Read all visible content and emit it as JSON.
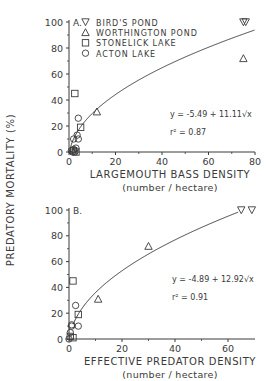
{
  "y_axis_shared_label": "PREDATORY MORTALITY (%)",
  "legend": {
    "items": [
      {
        "symbol": "triangle-down",
        "label": "BIRD'S POND"
      },
      {
        "symbol": "triangle-up",
        "label": "WORTHINGTON POND"
      },
      {
        "symbol": "square",
        "label": "STONELICK LAKE"
      },
      {
        "symbol": "circle",
        "label": "ACTON LAKE"
      }
    ]
  },
  "panelA": {
    "tag": "A.",
    "xlabel": "LARGEMOUTH BASS DENSITY",
    "xunits": "(number / hectare)",
    "equation": "y = -5.49 + 11.11√x",
    "r2": "r² = 0.87",
    "xticks": [
      "0",
      "20",
      "40",
      "60",
      "80"
    ],
    "yticks": [
      "0",
      "20",
      "40",
      "60",
      "80",
      "100"
    ]
  },
  "panelB": {
    "tag": "B.",
    "xlabel": "EFFECTIVE PREDATOR DENSITY",
    "xunits": "(number / hectare)",
    "equation": "y = -4.89 + 12.92√x",
    "r2": "r² = 0.91",
    "xticks": [
      "0",
      "20",
      "40",
      "60"
    ],
    "yticks": [
      "0",
      "20",
      "40",
      "60",
      "80",
      "100"
    ]
  },
  "chart_data": [
    {
      "type": "scatter",
      "title": "A.",
      "xlabel": "LARGEMOUTH BASS DENSITY (number / hectare)",
      "ylabel": "PREDATORY MORTALITY (%)",
      "xlim": [
        0,
        80
      ],
      "ylim": [
        0,
        100
      ],
      "grid": false,
      "legend_position": "upper left",
      "fit": {
        "equation": "y = -5.49 + 11.11*sqrt(x)",
        "r2": 0.87
      },
      "series": [
        {
          "name": "BIRD'S POND",
          "marker": "triangle-down",
          "x": [
            75,
            76
          ],
          "y": [
            100,
            100
          ]
        },
        {
          "name": "WORTHINGTON POND",
          "marker": "triangle-up",
          "x": [
            12,
            75
          ],
          "y": [
            31,
            72
          ]
        },
        {
          "name": "STONELICK LAKE",
          "marker": "square",
          "x": [
            2.5,
            5,
            3,
            2
          ],
          "y": [
            45,
            19,
            0,
            1
          ]
        },
        {
          "name": "ACTON LAKE",
          "marker": "circle",
          "x": [
            4,
            3.5,
            2,
            4,
            3,
            1,
            2,
            1.5,
            2.5
          ],
          "y": [
            26,
            13,
            10,
            10,
            3,
            1,
            2,
            0,
            0
          ]
        }
      ]
    },
    {
      "type": "scatter",
      "title": "B.",
      "xlabel": "EFFECTIVE PREDATOR DENSITY (number / hectare)",
      "ylabel": "PREDATORY MORTALITY (%)",
      "xlim": [
        0,
        70
      ],
      "ylim": [
        0,
        100
      ],
      "grid": false,
      "fit": {
        "equation": "y = -4.89 + 12.92*sqrt(x)",
        "r2": 0.91
      },
      "series": [
        {
          "name": "BIRD'S POND",
          "marker": "triangle-down",
          "x": [
            65,
            69
          ],
          "y": [
            100,
            100
          ]
        },
        {
          "name": "WORTHINGTON POND",
          "marker": "triangle-up",
          "x": [
            11,
            30
          ],
          "y": [
            31,
            72
          ]
        },
        {
          "name": "STONELICK LAKE",
          "marker": "square",
          "x": [
            1.5,
            3.5,
            1.5,
            0.5
          ],
          "y": [
            45,
            19,
            1,
            2
          ]
        },
        {
          "name": "ACTON LAKE",
          "marker": "circle",
          "x": [
            2.5,
            1,
            3.5,
            1,
            0.5,
            0
          ],
          "y": [
            26,
            11,
            10,
            10,
            5,
            0
          ]
        }
      ]
    }
  ]
}
